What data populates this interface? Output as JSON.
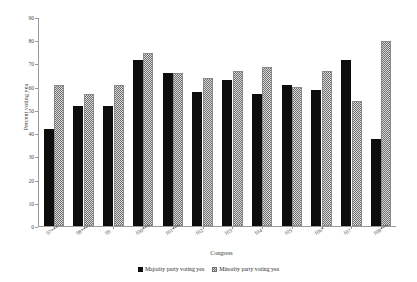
{
  "chart_data": {
    "type": "bar",
    "title": "",
    "xlabel": "Congress",
    "ylabel": "Percent voting yea",
    "ylim": [
      0,
      90
    ],
    "yticks": [
      0,
      10,
      20,
      30,
      40,
      50,
      60,
      70,
      80,
      90
    ],
    "grid": false,
    "legend_position": "bottom-center",
    "categories": [
      "97***",
      "98***",
      "99",
      "100***",
      "101***",
      "102",
      "103",
      "104",
      "105",
      "106*",
      "107",
      "108***"
    ],
    "series": [
      {
        "name": "Majority party voting yea",
        "color": "#0d0d0d",
        "pattern": "solid",
        "values": [
          42,
          52,
          52,
          72,
          66,
          58,
          63,
          57,
          61,
          59,
          72,
          37.5
        ]
      },
      {
        "name": "Minority party voting yea",
        "color": "#d8d8d8",
        "pattern": "checkered",
        "values": [
          61,
          57,
          61,
          75,
          66,
          64,
          67,
          69,
          60,
          67,
          54,
          80
        ]
      }
    ]
  },
  "legend": {
    "items": [
      {
        "label": "Majority party voting yea"
      },
      {
        "label": "Minority party voting yea"
      }
    ]
  }
}
